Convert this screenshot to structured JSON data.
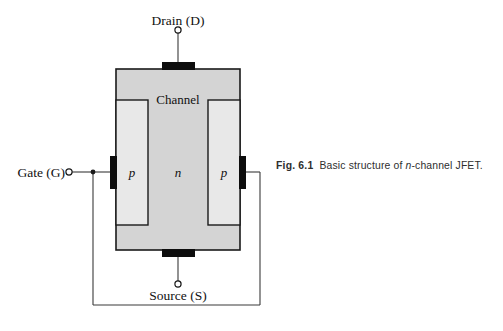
{
  "figure": {
    "caption_prefix": "Fig. 6.1",
    "caption_text_before": "Basic structure of ",
    "caption_italic": "n",
    "caption_text_after": "-channel JFET.",
    "caption_full": "Fig. 6.1 Basic structure of n-channel JFET."
  },
  "diagram": {
    "title_of_subject": "n-channel JFET",
    "terminals": {
      "drain": "Drain (D)",
      "source": "Source (S)",
      "gate": "Gate (G)"
    },
    "regions": {
      "channel": "Channel",
      "p_left": "p",
      "n_middle": "n",
      "p_right": "p"
    }
  },
  "colors": {
    "body_fill": "#d4d4d4",
    "p_region_fill": "#e8e8e8",
    "outline": "#1a1a1a",
    "contact_pad": "#0d0d0d",
    "wire": "#3a3a3a",
    "text": "#111111",
    "caption_text": "#2e2e2e",
    "page_background": "#ffffff"
  }
}
